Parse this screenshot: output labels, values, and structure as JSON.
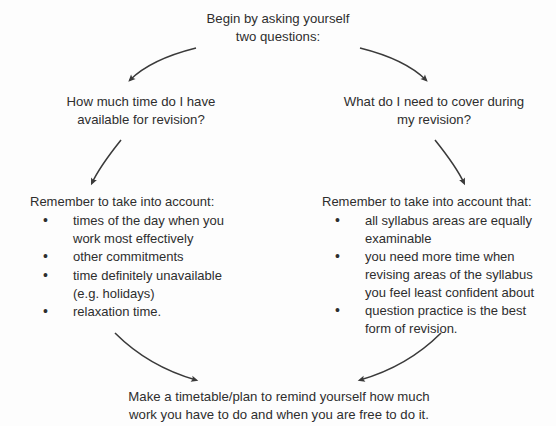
{
  "diagram": {
    "title_node": {
      "name": "start-prompt",
      "lines": [
        "Begin by asking yourself",
        "two questions:"
      ]
    },
    "question_left": {
      "name": "question-time-available",
      "lines": [
        "How much time do I have",
        "available for revision?"
      ]
    },
    "question_right": {
      "name": "question-coverage",
      "lines": [
        "What do I need to cover during",
        "my revision?"
      ]
    },
    "detail_left": {
      "name": "detail-time-considerations",
      "heading": "Remember to take into account:",
      "bullets": [
        [
          "times of the day when you",
          "work most effectively"
        ],
        [
          "other commitments"
        ],
        [
          "time definitely unavailable",
          "(e.g. holidays)"
        ],
        [
          "relaxation time."
        ]
      ]
    },
    "detail_right": {
      "name": "detail-coverage-considerations",
      "heading": "Remember to take into account that:",
      "bullets": [
        [
          "all syllabus areas are equally",
          "examinable"
        ],
        [
          "you need more time when",
          "revising areas of the syllabus",
          "you feel least confident about"
        ],
        [
          "question practice is the best",
          "form of revision."
        ]
      ]
    },
    "conclusion": {
      "name": "conclusion-make-timetable",
      "lines": [
        "Make a timetable/plan to remind yourself how much",
        "work you have to do and when you are free to do it."
      ]
    },
    "arrows": [
      {
        "name": "arrow-start-to-question-left",
        "direction": "down-left"
      },
      {
        "name": "arrow-start-to-question-right",
        "direction": "down-right"
      },
      {
        "name": "arrow-question-left-to-detail-left",
        "direction": "down-left"
      },
      {
        "name": "arrow-question-right-to-detail-right",
        "direction": "down-right"
      },
      {
        "name": "arrow-detail-left-to-conclusion",
        "direction": "down-right"
      },
      {
        "name": "arrow-detail-right-to-conclusion",
        "direction": "down-left"
      }
    ],
    "colors": {
      "background": "#fdfdfd",
      "text": "#2e2e2e",
      "arrow": "#3a3a3a"
    }
  }
}
